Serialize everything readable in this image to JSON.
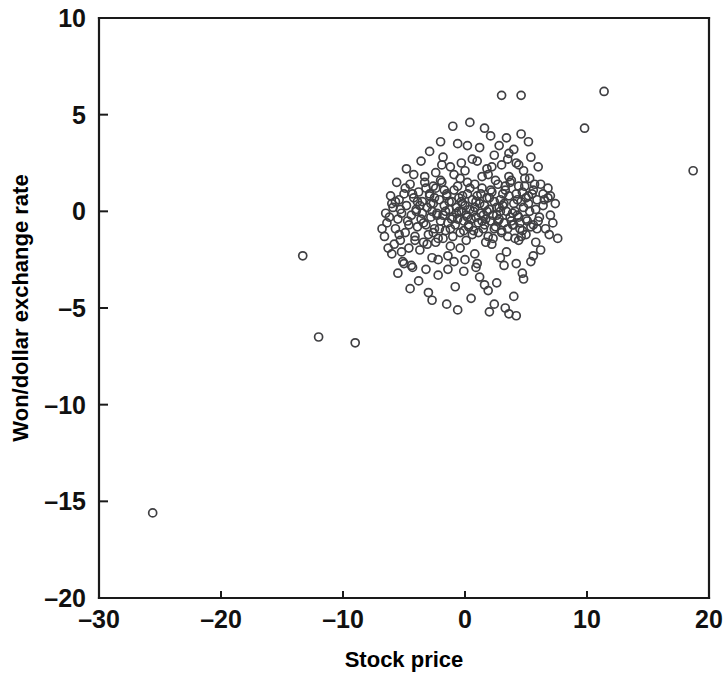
{
  "chart_data": {
    "type": "scatter",
    "title": "",
    "xlabel": "Stock price",
    "ylabel": "Won/dollar exchange rate",
    "xlim": [
      -30,
      20
    ],
    "ylim": [
      -20,
      10
    ],
    "xticks": [
      -30,
      -20,
      -10,
      0,
      10,
      20
    ],
    "yticks": [
      10,
      5,
      0,
      -5,
      -10,
      -15,
      -20
    ],
    "xtick_labels": [
      "–30",
      "–20",
      "–10",
      "0",
      "10",
      "20"
    ],
    "ytick_labels": [
      "10",
      "5",
      "0",
      "–5",
      "–10",
      "–15",
      "–20"
    ],
    "grid": false,
    "legend": null,
    "marker": {
      "shape": "open-circle",
      "radius_px": 4,
      "stroke_color": "#3f3f42",
      "fill": "none",
      "stroke_width_px": 1.7
    },
    "axis_color": "#1a1a1a",
    "background_color": "#ffffff",
    "n_points": 332,
    "points": [
      [
        -25.6,
        -15.6
      ],
      [
        -13.3,
        -2.3
      ],
      [
        -12.0,
        -6.5
      ],
      [
        -9.0,
        -6.8
      ],
      [
        -6.6,
        -1.3
      ],
      [
        -6.4,
        -0.6
      ],
      [
        -6.2,
        -0.3
      ],
      [
        -6.0,
        -2.2
      ],
      [
        -5.9,
        0.2
      ],
      [
        -5.7,
        -0.9
      ],
      [
        -5.5,
        -3.2
      ],
      [
        -5.4,
        0.6
      ],
      [
        -5.3,
        -1.5
      ],
      [
        -5.2,
        -0.1
      ],
      [
        -5.1,
        -2.6
      ],
      [
        -5.0,
        0.9
      ],
      [
        -4.9,
        -1.1
      ],
      [
        -4.8,
        0.3
      ],
      [
        -4.7,
        -0.5
      ],
      [
        -4.6,
        -1.9
      ],
      [
        -4.5,
        1.4
      ],
      [
        -4.4,
        -0.2
      ],
      [
        -4.3,
        -2.9
      ],
      [
        -4.2,
        0.7
      ],
      [
        -4.1,
        -1.3
      ],
      [
        -4.0,
        0.1
      ],
      [
        -3.9,
        -0.8
      ],
      [
        -3.8,
        1.0
      ],
      [
        -3.7,
        -2.0
      ],
      [
        -3.6,
        -0.4
      ],
      [
        -3.5,
        0.5
      ],
      [
        -3.4,
        -1.6
      ],
      [
        -3.3,
        1.8
      ],
      [
        -3.2,
        -0.7
      ],
      [
        -3.1,
        0.2
      ],
      [
        -3.0,
        -1.2
      ],
      [
        -2.9,
        0.9
      ],
      [
        -2.8,
        -0.3
      ],
      [
        -2.7,
        -2.4
      ],
      [
        -2.6,
        0.4
      ],
      [
        -2.5,
        -0.9
      ],
      [
        -2.4,
        1.2
      ],
      [
        -2.3,
        -0.1
      ],
      [
        -2.2,
        -1.4
      ],
      [
        -2.1,
        0.6
      ],
      [
        -2.0,
        -0.5
      ],
      [
        -1.9,
        1.5
      ],
      [
        -1.8,
        -0.2
      ],
      [
        -1.7,
        0.3
      ],
      [
        -1.6,
        -1.0
      ],
      [
        -1.5,
        0.8
      ],
      [
        -1.4,
        -0.6
      ],
      [
        -1.3,
        0.1
      ],
      [
        -1.2,
        -1.8
      ],
      [
        -1.1,
        0.5
      ],
      [
        -1.0,
        -0.3
      ],
      [
        -0.9,
        1.1
      ],
      [
        -0.8,
        -0.7
      ],
      [
        -0.7,
        0.2
      ],
      [
        -0.6,
        -0.4
      ],
      [
        -0.5,
        0.7
      ],
      [
        -0.4,
        -1.1
      ],
      [
        -0.3,
        0.0
      ],
      [
        -0.2,
        0.4
      ],
      [
        -0.1,
        -0.5
      ],
      [
        0.0,
        0.3
      ],
      [
        0.1,
        -0.2
      ],
      [
        0.2,
        0.9
      ],
      [
        0.3,
        -0.8
      ],
      [
        0.4,
        0.1
      ],
      [
        0.5,
        -0.4
      ],
      [
        0.6,
        0.6
      ],
      [
        0.7,
        -1.0
      ],
      [
        0.8,
        0.2
      ],
      [
        0.9,
        -0.3
      ],
      [
        1.0,
        0.8
      ],
      [
        1.1,
        -0.6
      ],
      [
        1.2,
        0.4
      ],
      [
        1.3,
        -0.1
      ],
      [
        1.4,
        1.2
      ],
      [
        1.5,
        -0.9
      ],
      [
        1.6,
        0.3
      ],
      [
        1.7,
        -0.4
      ],
      [
        1.8,
        0.7
      ],
      [
        1.9,
        -1.3
      ],
      [
        2.0,
        0.1
      ],
      [
        2.1,
        -0.5
      ],
      [
        2.2,
        1.0
      ],
      [
        2.3,
        -0.2
      ],
      [
        2.4,
        0.5
      ],
      [
        2.5,
        -0.8
      ],
      [
        2.6,
        0.2
      ],
      [
        2.7,
        1.4
      ],
      [
        2.8,
        -0.4
      ],
      [
        2.9,
        0.6
      ],
      [
        3.0,
        -1.1
      ],
      [
        3.1,
        0.3
      ],
      [
        3.2,
        -0.6
      ],
      [
        3.3,
        1.1
      ],
      [
        3.4,
        0.0
      ],
      [
        3.5,
        -0.9
      ],
      [
        3.6,
        0.8
      ],
      [
        3.7,
        -0.3
      ],
      [
        3.8,
        1.6
      ],
      [
        3.9,
        -0.7
      ],
      [
        4.0,
        0.4
      ],
      [
        4.1,
        -1.4
      ],
      [
        4.2,
        0.9
      ],
      [
        4.3,
        -0.2
      ],
      [
        4.4,
        1.3
      ],
      [
        4.5,
        -0.6
      ],
      [
        4.6,
        0.5
      ],
      [
        4.7,
        -1.0
      ],
      [
        4.8,
        0.2
      ],
      [
        4.9,
        1.7
      ],
      [
        5.0,
        -0.4
      ],
      [
        5.2,
        0.8
      ],
      [
        5.4,
        -0.8
      ],
      [
        5.6,
        1.1
      ],
      [
        5.8,
        0.1
      ],
      [
        6.0,
        -0.5
      ],
      [
        6.2,
        1.4
      ],
      [
        6.4,
        0.3
      ],
      [
        6.6,
        -0.9
      ],
      [
        6.8,
        0.7
      ],
      [
        7.0,
        -0.2
      ],
      [
        -4.8,
        2.2
      ],
      [
        -4.2,
        1.9
      ],
      [
        -3.6,
        2.6
      ],
      [
        -2.9,
        3.1
      ],
      [
        -2.4,
        2.0
      ],
      [
        -1.8,
        2.8
      ],
      [
        -1.2,
        2.3
      ],
      [
        -0.6,
        3.5
      ],
      [
        0.0,
        2.1
      ],
      [
        0.6,
        2.7
      ],
      [
        1.2,
        3.3
      ],
      [
        1.8,
        2.2
      ],
      [
        2.4,
        2.9
      ],
      [
        3.0,
        2.4
      ],
      [
        3.6,
        3.0
      ],
      [
        4.2,
        2.5
      ],
      [
        4.8,
        2.1
      ],
      [
        5.4,
        2.8
      ],
      [
        6.0,
        2.3
      ],
      [
        -1.0,
        4.4
      ],
      [
        0.4,
        4.6
      ],
      [
        1.6,
        4.3
      ],
      [
        2.1,
        3.9
      ],
      [
        3.4,
        3.8
      ],
      [
        4.6,
        4.0
      ],
      [
        5.2,
        3.6
      ],
      [
        3.0,
        6.0
      ],
      [
        4.6,
        6.0
      ],
      [
        11.4,
        6.2
      ],
      [
        9.8,
        4.3
      ],
      [
        18.7,
        2.1
      ],
      [
        -3.8,
        -3.6
      ],
      [
        -3.0,
        -4.2
      ],
      [
        -2.2,
        -3.3
      ],
      [
        -1.5,
        -4.8
      ],
      [
        -0.8,
        -3.9
      ],
      [
        -0.1,
        -3.1
      ],
      [
        0.5,
        -4.5
      ],
      [
        1.2,
        -3.4
      ],
      [
        1.9,
        -4.1
      ],
      [
        2.6,
        -3.7
      ],
      [
        3.3,
        -5.0
      ],
      [
        4.0,
        -4.4
      ],
      [
        4.7,
        -3.2
      ],
      [
        2.0,
        -5.2
      ],
      [
        3.6,
        -5.3
      ],
      [
        0.9,
        -2.9
      ],
      [
        -4.4,
        -2.8
      ],
      [
        -5.2,
        -2.1
      ],
      [
        5.4,
        -2.6
      ],
      [
        6.2,
        -2.0
      ],
      [
        -2.6,
        -1.1
      ],
      [
        -1.4,
        -2.3
      ],
      [
        -0.4,
        -1.9
      ],
      [
        0.8,
        -2.2
      ],
      [
        2.2,
        -1.7
      ],
      [
        3.4,
        -2.1
      ],
      [
        4.4,
        -1.5
      ],
      [
        5.0,
        -1.2
      ],
      [
        -6.1,
        0.8
      ],
      [
        -5.6,
        1.5
      ],
      [
        6.8,
        1.2
      ],
      [
        7.4,
        0.4
      ],
      [
        -3.2,
        1.2
      ],
      [
        -2.0,
        1.6
      ],
      [
        -0.9,
        1.9
      ],
      [
        0.2,
        1.5
      ],
      [
        1.4,
        1.8
      ],
      [
        2.5,
        1.6
      ],
      [
        3.7,
        1.5
      ],
      [
        4.9,
        1.3
      ],
      [
        -4.0,
        0.0
      ],
      [
        -2.7,
        0.0
      ],
      [
        -1.6,
        0.0
      ],
      [
        -0.5,
        0.0
      ],
      [
        0.7,
        0.0
      ],
      [
        1.8,
        0.0
      ],
      [
        2.9,
        0.0
      ],
      [
        4.1,
        0.0
      ],
      [
        5.3,
        0.0
      ],
      [
        5.9,
        0.6
      ],
      [
        -3.4,
        -0.6
      ],
      [
        -2.1,
        -0.9
      ],
      [
        -1.0,
        -1.3
      ],
      [
        0.1,
        -1.5
      ],
      [
        1.1,
        -1.1
      ],
      [
        2.3,
        -1.4
      ],
      [
        3.5,
        -1.3
      ],
      [
        4.5,
        -0.9
      ],
      [
        5.6,
        -0.7
      ],
      [
        6.5,
        0.6
      ],
      [
        -5.8,
        -1.7
      ],
      [
        -6.5,
        -0.1
      ],
      [
        -6.8,
        -0.9
      ],
      [
        7.2,
        -0.6
      ],
      [
        -2.5,
        0.7
      ],
      [
        -1.3,
        0.5
      ],
      [
        -0.2,
        0.8
      ],
      [
        0.9,
        0.5
      ],
      [
        2.0,
        0.7
      ],
      [
        3.1,
        0.9
      ],
      [
        4.3,
        0.6
      ],
      [
        5.5,
        0.9
      ],
      [
        -3.9,
        0.5
      ],
      [
        -4.6,
        -0.7
      ],
      [
        -0.7,
        -0.1
      ],
      [
        0.3,
        -0.7
      ],
      [
        1.5,
        -0.2
      ],
      [
        2.7,
        -0.5
      ],
      [
        3.9,
        -0.1
      ],
      [
        5.1,
        -0.5
      ],
      [
        -2.3,
        -0.2
      ],
      [
        -1.1,
        -0.4
      ],
      [
        -0.3,
        0.5
      ],
      [
        0.4,
        1.2
      ],
      [
        1.6,
        -0.7
      ],
      [
        2.8,
        0.2
      ],
      [
        4.0,
        -0.7
      ],
      [
        5.2,
        0.4
      ],
      [
        -3.1,
        -1.7
      ],
      [
        -2.8,
        0.4
      ],
      [
        -1.7,
        1.1
      ],
      [
        0.6,
        -1.2
      ],
      [
        1.3,
        0.9
      ],
      [
        2.4,
        -0.9
      ],
      [
        3.2,
        0.4
      ],
      [
        4.4,
        -0.3
      ],
      [
        -4.9,
        1.2
      ],
      [
        -5.3,
        0.1
      ],
      [
        -0.9,
        -2.6
      ],
      [
        -2.2,
        -2.5
      ],
      [
        1.0,
        -2.7
      ],
      [
        2.9,
        -2.4
      ],
      [
        4.2,
        -2.7
      ],
      [
        5.8,
        -1.6
      ],
      [
        -1.9,
        2.4
      ],
      [
        -0.3,
        2.5
      ],
      [
        1.0,
        2.6
      ],
      [
        2.2,
        2.3
      ],
      [
        3.5,
        2.7
      ],
      [
        4.4,
        2.4
      ],
      [
        -3.3,
        1.5
      ],
      [
        -2.6,
        1.3
      ],
      [
        6.4,
        0.9
      ],
      [
        6.9,
        -1.2
      ],
      [
        -6.3,
        -1.9
      ],
      [
        -5.0,
        -2.7
      ],
      [
        -4.1,
        -1.5
      ],
      [
        -3.5,
        -0.1
      ],
      [
        -2.4,
        -1.6
      ],
      [
        -1.2,
        -0.9
      ],
      [
        0.2,
        -0.3
      ],
      [
        1.4,
        -0.5
      ],
      [
        2.6,
        -0.2
      ],
      [
        3.8,
        -0.5
      ],
      [
        5.0,
        0.7
      ],
      [
        6.1,
        -0.3
      ],
      [
        -0.6,
        1.3
      ],
      [
        0.8,
        1.4
      ],
      [
        2.1,
        1.1
      ],
      [
        3.3,
        1.3
      ],
      [
        4.7,
        1.0
      ],
      [
        5.7,
        1.4
      ],
      [
        -1.5,
        0.9
      ],
      [
        -2.9,
        0.8
      ],
      [
        -4.3,
        0.9
      ],
      [
        -5.5,
        -0.4
      ],
      [
        -1.8,
        -1.4
      ],
      [
        -0.1,
        -1.0
      ],
      [
        1.7,
        -1.6
      ],
      [
        3.0,
        -1.0
      ],
      [
        4.6,
        -1.3
      ],
      [
        5.9,
        -0.9
      ],
      [
        -2.0,
        3.6
      ],
      [
        0.2,
        3.4
      ],
      [
        2.8,
        3.4
      ],
      [
        4.0,
        3.2
      ],
      [
        -0.4,
        1.7
      ],
      [
        1.9,
        1.9
      ],
      [
        3.6,
        1.8
      ],
      [
        5.3,
        1.7
      ],
      [
        -3.7,
        0.3
      ],
      [
        -5.7,
        0.5
      ],
      [
        -1.4,
        -3.0
      ],
      [
        0.0,
        -2.5
      ],
      [
        1.6,
        -3.8
      ],
      [
        3.2,
        -2.8
      ],
      [
        4.8,
        -3.5
      ],
      [
        -2.7,
        -4.6
      ],
      [
        -0.6,
        -5.1
      ],
      [
        2.4,
        -4.8
      ],
      [
        4.2,
        -5.4
      ],
      [
        5.6,
        -2.3
      ],
      [
        -4.5,
        -4.0
      ],
      [
        -3.2,
        -3.0
      ],
      [
        -5.4,
        -1.2
      ],
      [
        -6.0,
        0.4
      ],
      [
        7.0,
        0.8
      ],
      [
        7.6,
        -1.4
      ]
    ]
  }
}
